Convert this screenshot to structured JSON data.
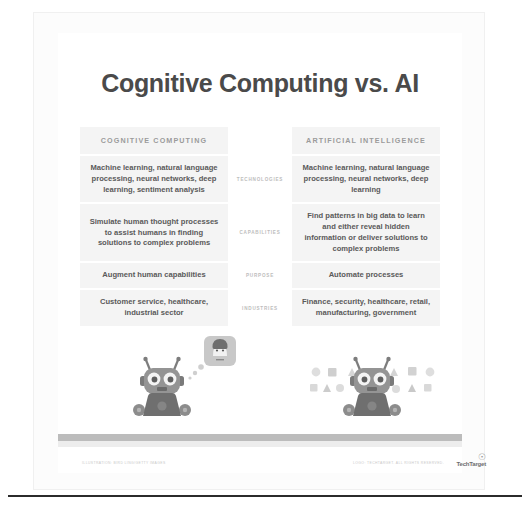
{
  "title": "Cognitive Computing vs. AI",
  "columns": {
    "left": "COGNITIVE COMPUTING",
    "middle": "",
    "right": "ARTIFICIAL INTELLIGENCE"
  },
  "rows": [
    {
      "label": "TECHNOLOGIES",
      "left": "Machine learning, natural language processing, neural networks, deep learning, sentiment analysis",
      "right": "Machine learning, natural language processing, neural networks, deep learning"
    },
    {
      "label": "CAPABILITIES",
      "left": "Simulate human thought processes to assist humans in finding solutions to complex problems",
      "right": "Find patterns in big data to learn and either reveal hidden information or deliver solutions to complex problems"
    },
    {
      "label": "PURPOSE",
      "left": "Augment human capabilities",
      "right": "Automate processes"
    },
    {
      "label": "INDUSTRIES",
      "left": "Customer service, healthcare, industrial sector",
      "right": "Finance, security, healthcare, retail, manufacturing, government"
    }
  ],
  "illustration": {
    "left_robot": {
      "name": "robot-with-thought-bubble",
      "bubble_icon": "person-avatar-icon"
    },
    "right_robot": {
      "name": "robot-with-data-shapes",
      "shape_icons": [
        "circle-icon",
        "square-icon",
        "triangle-icon"
      ]
    }
  },
  "footer": {
    "credit_left": "ILLUSTRATION: BIRD LING/GETTY IMAGES",
    "credit_right": "LOGO: TECHTARGET. ALL RIGHTS RESERVED.",
    "logo_text": "TechTarget"
  },
  "colors": {
    "panel": "#f4f4f4",
    "title": "#4a4a4a",
    "body_text": "#5a5a5a",
    "header_text": "#9b9b9b",
    "mid_label": "#bdbdbd",
    "robot": "#8e8e8e",
    "robot_dark": "#6d6d6d",
    "ground": "#bcbcbc"
  }
}
